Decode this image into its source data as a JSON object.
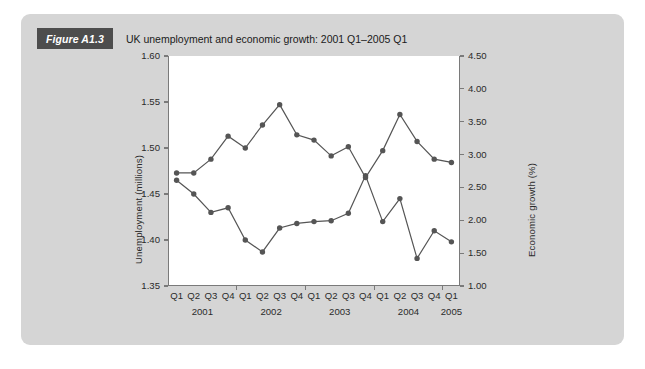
{
  "figure": {
    "tag": "Figure A1.3",
    "caption": "UK unemployment and economic growth: 2001 Q1–2005 Q1"
  },
  "chart_data": {
    "type": "line",
    "title": "UK unemployment and economic growth: 2001 Q1–2005 Q1",
    "xlabel": "",
    "grid": false,
    "legend": "none",
    "marker": "filled-circle",
    "series_color": "#555555",
    "categories": [
      "Q1",
      "Q2",
      "Q3",
      "Q4",
      "Q1",
      "Q2",
      "Q3",
      "Q4",
      "Q1",
      "Q2",
      "Q3",
      "Q4",
      "Q1",
      "Q2",
      "Q3",
      "Q4",
      "Q1"
    ],
    "year_groups": [
      {
        "label": "2001",
        "quarters": [
          "Q1",
          "Q2",
          "Q3",
          "Q4"
        ]
      },
      {
        "label": "2002",
        "quarters": [
          "Q1",
          "Q2",
          "Q3",
          "Q4"
        ]
      },
      {
        "label": "2003",
        "quarters": [
          "Q1",
          "Q2",
          "Q3",
          "Q4"
        ]
      },
      {
        "label": "2004",
        "quarters": [
          "Q1",
          "Q2",
          "Q3",
          "Q4"
        ]
      },
      {
        "label": "2005",
        "quarters": [
          "Q1"
        ]
      }
    ],
    "x_periods": [
      "2001 Q1",
      "2001 Q2",
      "2001 Q3",
      "2001 Q4",
      "2002 Q1",
      "2002 Q2",
      "2002 Q3",
      "2002 Q4",
      "2003 Q1",
      "2003 Q2",
      "2003 Q3",
      "2003 Q4",
      "2004 Q1",
      "2004 Q2",
      "2004 Q3",
      "2004 Q4",
      "2005 Q1"
    ],
    "axes": {
      "left": {
        "label": "Unemployment (millions)",
        "min": 1.35,
        "max": 1.6,
        "ticks": [
          1.35,
          1.4,
          1.45,
          1.5,
          1.55,
          1.6
        ],
        "tick_labels": [
          "1.35",
          "1.40",
          "1.45",
          "1.50",
          "1.55",
          "1.60"
        ]
      },
      "right": {
        "label": "Economic growth (%)",
        "min": 1.0,
        "max": 4.5,
        "ticks": [
          1.0,
          1.5,
          2.0,
          2.5,
          3.0,
          3.5,
          4.0,
          4.5
        ],
        "tick_labels": [
          "1.00",
          "1.50",
          "2.00",
          "2.50",
          "3.00",
          "3.50",
          "4.00",
          "4.50"
        ]
      }
    },
    "series": [
      {
        "name": "Unemployment (millions)",
        "axis": "left",
        "values": [
          1.465,
          1.45,
          1.43,
          1.435,
          1.4,
          1.387,
          1.413,
          1.418,
          1.42,
          1.421,
          1.429,
          1.47,
          1.42,
          1.445,
          1.38,
          1.41,
          1.398
        ]
      },
      {
        "name": "Economic growth (%)",
        "axis": "right",
        "values": [
          2.72,
          2.72,
          2.93,
          3.28,
          3.1,
          3.45,
          3.76,
          3.3,
          3.22,
          2.98,
          3.12,
          2.65,
          3.06,
          3.61,
          3.2,
          2.93,
          2.88
        ]
      }
    ]
  }
}
